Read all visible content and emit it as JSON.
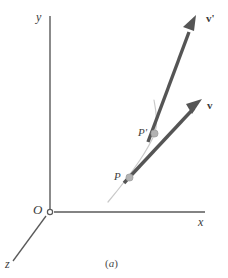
{
  "figure": {
    "caption": "(a)",
    "caption_italic_part": "a",
    "background_color": "#ffffff",
    "axes": {
      "y_label": "y",
      "x_label": "x",
      "z_label": "z",
      "origin_label": "O",
      "axis_color": "#5a5a5a",
      "origin_marker": "open-circle"
    },
    "points": [
      {
        "id": "P",
        "label": "P",
        "marker_color": "#b3b3b3",
        "x": 129,
        "y": 177
      },
      {
        "id": "Pp",
        "label": "P'",
        "marker_color": "#b3b3b3",
        "x": 155,
        "y": 134
      }
    ],
    "vectors": [
      {
        "id": "v",
        "label": "v",
        "color": "#555555",
        "tail": {
          "x": 125,
          "y": 182
        },
        "tip": {
          "x": 201,
          "y": 101
        }
      },
      {
        "id": "vprime",
        "label": "v'",
        "color": "#555555",
        "tail": {
          "x": 149,
          "y": 141
        },
        "tip": {
          "x": 196,
          "y": 16
        }
      }
    ],
    "curve": {
      "id": "trajectory-curve",
      "color": "#c9c9c9",
      "description": "thin light gray curve through P and P'"
    }
  }
}
